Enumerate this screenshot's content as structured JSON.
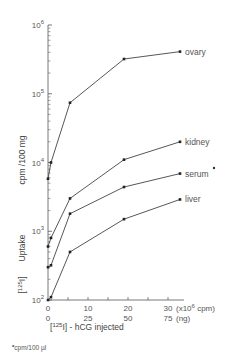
{
  "chart_data": {
    "type": "line",
    "title": "",
    "xlabel": "[125I]-hCG injected",
    "ylabel": "[125I] Uptake cpm/100 mg",
    "x_units_primary": "(x10^6 cpm)",
    "x_units_secondary": "(ng)",
    "x_ticks_primary": [
      "0",
      "10",
      "20",
      "30"
    ],
    "x_ticks_secondary": [
      "0",
      "25",
      "50",
      "75"
    ],
    "xlim": [
      0,
      35
    ],
    "y_scale": "log",
    "ylim": [
      100,
      1000000
    ],
    "y_ticks": [
      "10^2",
      "10^3",
      "10^4",
      "10^5",
      "10^6"
    ],
    "grid": false,
    "legend_position": "inline labels at right end of lines",
    "footnote": "*cpm/100 µl",
    "series": [
      {
        "name": "ovary",
        "x": [
          0,
          0.75,
          5.5,
          19,
          33
        ],
        "values": [
          5800,
          10000,
          74000,
          320000,
          410000
        ]
      },
      {
        "name": "kidney",
        "x": [
          0,
          0.75,
          5.5,
          19,
          33
        ],
        "values": [
          600,
          800,
          3000,
          11000,
          20000
        ]
      },
      {
        "name": "serum",
        "x": [
          0,
          0.75,
          5.5,
          19,
          33
        ],
        "values": [
          300,
          320,
          1800,
          4400,
          6900
        ],
        "note": "*"
      },
      {
        "name": "liver",
        "x": [
          0,
          0.75,
          5.5,
          19,
          33
        ],
        "values": [
          100,
          110,
          500,
          1500,
          2900
        ]
      }
    ]
  },
  "labels": {
    "y_upper": "cpm /100 mg",
    "y_lower_bracket": "125I",
    "y_lower_word": "Uptake",
    "x_title_bracket": "125I",
    "x_title_rest": "- hCG injected",
    "x_unit_primary": "(x10",
    "x_unit_primary_exp": "6",
    "x_unit_primary_tail": "cpm)",
    "x_unit_secondary": "(ng)",
    "footnote_text": "cpm/100 µl",
    "footnote_mark": "•",
    "serum_mark": "•"
  }
}
